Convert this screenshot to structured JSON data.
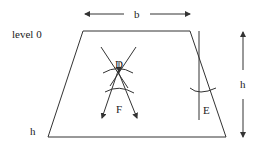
{
  "diagram": {
    "labels": {
      "level": "level 0",
      "width": "b",
      "height_right": "h",
      "height_left": "h",
      "region_d": "D",
      "region_f": "F",
      "region_e": "E"
    },
    "shapes": {
      "trapezoid": "trapezoid-outline",
      "crossing_lines": "x-crossing-lines",
      "vertical_line": "vertical-line-e",
      "arcs": [
        "arc-d",
        "arc-f",
        "arc-e"
      ]
    },
    "arrows": [
      "width-arrow-left",
      "width-arrow-right",
      "height-arrow-up",
      "height-arrow-down",
      "cross-arrow-left",
      "cross-arrow-right",
      "center-arrow-down"
    ]
  }
}
